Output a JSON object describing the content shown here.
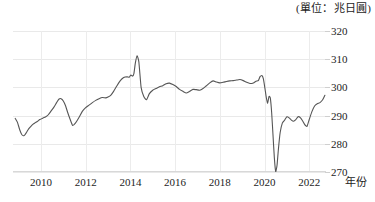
{
  "unit_caption": "(單位：兆日圓)",
  "chart_data": {
    "type": "line",
    "title": "",
    "subtitle": "",
    "xlabel": "年份",
    "ylabel": "",
    "unit_note": "(單位：兆日圓)",
    "xlim": [
      2008.75,
      2022.75
    ],
    "ylim": [
      270,
      320
    ],
    "yticks": [
      320,
      310,
      300,
      290,
      280,
      270
    ],
    "ytick_labels": [
      "320",
      "310",
      "300",
      "290",
      "280",
      "270"
    ],
    "xticks": [
      2010,
      2012,
      2014,
      2016,
      2018,
      2020,
      2022
    ],
    "xtick_labels": [
      "2010",
      "2012",
      "2014",
      "2016",
      "2018",
      "2020",
      "2022"
    ],
    "grid": true,
    "legend": null,
    "legend_position": "none",
    "line_color": "#555555",
    "line_width": 1.1,
    "series": [
      {
        "name": "餘額",
        "x": [
          2008.85,
          2008.95,
          2009.05,
          2009.15,
          2009.25,
          2009.35,
          2009.45,
          2009.55,
          2009.65,
          2009.75,
          2009.85,
          2009.95,
          2010.08,
          2010.2,
          2010.33,
          2010.45,
          2010.58,
          2010.7,
          2010.8,
          2010.9,
          2011.0,
          2011.1,
          2011.2,
          2011.3,
          2011.42,
          2011.55,
          2011.7,
          2011.85,
          2012.0,
          2012.15,
          2012.3,
          2012.45,
          2012.6,
          2012.75,
          2012.9,
          2013.0,
          2013.12,
          2013.25,
          2013.4,
          2013.55,
          2013.7,
          2013.85,
          2013.95,
          2014.02,
          2014.1,
          2014.16,
          2014.22,
          2014.3,
          2014.38,
          2014.48,
          2014.6,
          2014.72,
          2014.85,
          2015.0,
          2015.15,
          2015.3,
          2015.45,
          2015.6,
          2015.75,
          2015.9,
          2016.05,
          2016.2,
          2016.35,
          2016.5,
          2016.65,
          2016.8,
          2016.95,
          2017.1,
          2017.25,
          2017.4,
          2017.55,
          2017.7,
          2017.85,
          2018.0,
          2018.15,
          2018.3,
          2018.45,
          2018.6,
          2018.75,
          2018.9,
          2019.05,
          2019.2,
          2019.35,
          2019.5,
          2019.62,
          2019.72,
          2019.8,
          2019.88,
          2019.95,
          2020.02,
          2020.08,
          2020.14,
          2020.2,
          2020.26,
          2020.32,
          2020.38,
          2020.44,
          2020.5,
          2020.56,
          2020.62,
          2020.7,
          2020.8,
          2020.9,
          2021.0,
          2021.1,
          2021.2,
          2021.3,
          2021.4,
          2021.5,
          2021.6,
          2021.7,
          2021.8,
          2021.9,
          2022.0,
          2022.12,
          2022.24,
          2022.36,
          2022.48,
          2022.6,
          2022.7
        ],
        "y": [
          289.0,
          287.6,
          285.0,
          283.2,
          282.9,
          284.0,
          285.3,
          286.2,
          287.0,
          287.5,
          288.0,
          288.6,
          289.1,
          289.5,
          290.3,
          291.6,
          293.0,
          294.6,
          295.8,
          296.0,
          295.2,
          293.5,
          291.0,
          288.8,
          286.5,
          287.4,
          289.3,
          291.5,
          292.8,
          293.7,
          294.6,
          295.4,
          296.0,
          296.4,
          296.3,
          296.6,
          297.2,
          298.6,
          300.6,
          302.4,
          303.5,
          303.8,
          303.6,
          304.4,
          304.0,
          305.0,
          308.5,
          311.2,
          309.0,
          300.0,
          296.8,
          295.6,
          297.8,
          299.0,
          299.6,
          300.2,
          300.6,
          301.3,
          301.5,
          301.0,
          300.3,
          299.3,
          298.6,
          298.0,
          298.6,
          299.3,
          299.2,
          299.0,
          299.6,
          300.6,
          301.6,
          302.3,
          301.9,
          301.6,
          301.8,
          302.1,
          302.3,
          302.4,
          302.6,
          302.8,
          302.4,
          301.8,
          301.4,
          301.6,
          302.2,
          302.4,
          303.8,
          304.2,
          303.0,
          299.6,
          296.4,
          294.4,
          296.8,
          296.2,
          291.0,
          283.0,
          275.0,
          270.2,
          272.4,
          278.0,
          284.0,
          287.4,
          288.4,
          289.6,
          289.2,
          288.4,
          288.0,
          288.6,
          289.6,
          289.3,
          288.2,
          286.8,
          286.2,
          288.6,
          291.4,
          293.4,
          294.2,
          294.6,
          295.6,
          297.2
        ]
      }
    ],
    "annotations": [
      {
        "text": "2014 spike",
        "x": 2014.22,
        "y": 311.2
      },
      {
        "text": "2020 trough",
        "x": 2020.44,
        "y": 270.2
      }
    ]
  }
}
